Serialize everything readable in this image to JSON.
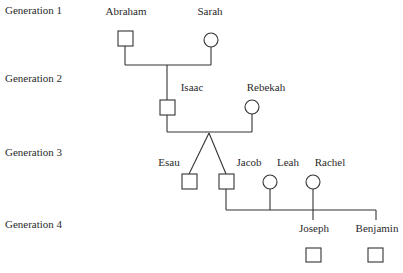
{
  "diagram": {
    "type": "pedigree",
    "generations": [
      {
        "label": "Generation 1",
        "y": 4
      },
      {
        "label": "Generation 2",
        "y": 72
      },
      {
        "label": "Generation 3",
        "y": 146
      },
      {
        "label": "Generation 4",
        "y": 218
      }
    ],
    "people": [
      {
        "id": "abraham",
        "name": "Abraham",
        "sex": "male",
        "generation": 1
      },
      {
        "id": "sarah",
        "name": "Sarah",
        "sex": "female",
        "generation": 1
      },
      {
        "id": "isaac",
        "name": "Isaac",
        "sex": "male",
        "generation": 2
      },
      {
        "id": "rebekah",
        "name": "Rebekah",
        "sex": "female",
        "generation": 2
      },
      {
        "id": "esau",
        "name": "Esau",
        "sex": "male",
        "generation": 3
      },
      {
        "id": "jacob",
        "name": "Jacob",
        "sex": "male",
        "generation": 3
      },
      {
        "id": "leah",
        "name": "Leah",
        "sex": "female",
        "generation": 3
      },
      {
        "id": "rachel",
        "name": "Rachel",
        "sex": "female",
        "generation": 3
      },
      {
        "id": "joseph",
        "name": "Joseph",
        "sex": "male",
        "generation": 4
      },
      {
        "id": "benjamin",
        "name": "Benjamin",
        "sex": "male",
        "generation": 4
      }
    ],
    "relationships": [
      {
        "parents": [
          "Abraham",
          "Sarah"
        ],
        "children": [
          "Isaac"
        ]
      },
      {
        "parents": [
          "Isaac",
          "Rebekah"
        ],
        "children": [
          "Esau",
          "Jacob"
        ],
        "twins": true
      },
      {
        "parents": [
          "Jacob",
          "Leah",
          "Rachel"
        ],
        "children": [
          "Joseph",
          "Benjamin"
        ]
      }
    ],
    "legend": {
      "square": "male",
      "circle": "female"
    }
  }
}
